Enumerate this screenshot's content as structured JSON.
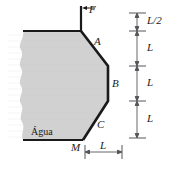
{
  "figure": {
    "fill_color": "#d2d2d2",
    "outline_color": "#1a1a1a",
    "dimension_color": "#55555a",
    "background": "#ffffff"
  },
  "labels": {
    "force": "F",
    "point_a": "A",
    "point_b": "B",
    "point_c": "C",
    "point_m": "M",
    "water": "Água"
  },
  "dimensions": {
    "vertical": [
      {
        "id": "d1",
        "text": "L/2"
      },
      {
        "id": "d2",
        "text": "L"
      },
      {
        "id": "d3",
        "text": "L"
      },
      {
        "id": "d4",
        "text": "L"
      }
    ],
    "horizontal": [
      {
        "id": "h1",
        "text": "L"
      }
    ]
  },
  "geometry": {
    "outline_points": "81,31 108,66 108,101 83,140",
    "top_edge": "23,31 81,31",
    "bottom_edge": "23,140 83,140",
    "force_stem": "81,6 81,31",
    "force_arrow_y": 8,
    "dim_line_x": 137,
    "dim_ticks_y": [
      13,
      31,
      66,
      101,
      138
    ],
    "hdim_y": 152,
    "hdim_x1": 85,
    "hdim_x2": 122
  }
}
